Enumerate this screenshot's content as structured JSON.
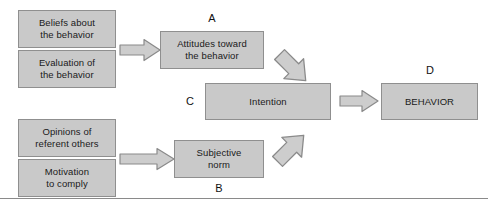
{
  "diagram": {
    "colors": {
      "box_fill": "#c9c9c9",
      "box_border": "#8f8f8f",
      "arrow_fill": "#cdcdcd",
      "arrow_border": "#8a8a8a",
      "text": "#1a1a1a",
      "rule": "#8a8a8a",
      "background": "#ffffff"
    },
    "boxes": [
      {
        "id": "beliefs",
        "line1": "Beliefs about",
        "line2": "the behavior"
      },
      {
        "id": "evaluation",
        "line1": "Evaluation of",
        "line2": "the behavior"
      },
      {
        "id": "opinions",
        "line1": "Opinions of",
        "line2": "referent others"
      },
      {
        "id": "motivation",
        "line1": "Motivation",
        "line2": "to comply"
      },
      {
        "id": "attitudes",
        "line1": "Attitudes toward",
        "line2": "the behavior"
      },
      {
        "id": "subjective",
        "line1": "Subjective",
        "line2": "norm"
      },
      {
        "id": "intention",
        "line1": "Intention",
        "line2": ""
      },
      {
        "id": "behavior",
        "line1": "BEHAVIOR",
        "line2": ""
      }
    ],
    "labels": [
      {
        "id": "a",
        "text": "A"
      },
      {
        "id": "b",
        "text": "B"
      },
      {
        "id": "c",
        "text": "C"
      },
      {
        "id": "d",
        "text": "D"
      }
    ],
    "arrows": [
      {
        "id": "beliefs-to-attitudes",
        "direction": "right"
      },
      {
        "id": "opinions-to-subjective",
        "direction": "right"
      },
      {
        "id": "attitudes-to-intention",
        "direction": "down-right"
      },
      {
        "id": "subjective-to-intention",
        "direction": "up-right"
      },
      {
        "id": "intention-to-behavior",
        "direction": "right"
      }
    ]
  }
}
